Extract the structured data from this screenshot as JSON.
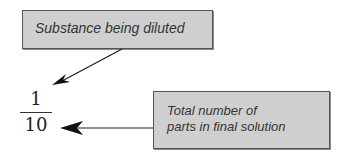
{
  "diagram": {
    "top_label": "Substance being diluted",
    "bottom_label_line1": "Total number of",
    "bottom_label_line2": "parts in final solution",
    "fraction": {
      "numerator": "1",
      "denominator": "10"
    }
  },
  "colors": {
    "box_fill": "#cfcfcf",
    "box_border": "#555555",
    "arrow": "#222222"
  }
}
